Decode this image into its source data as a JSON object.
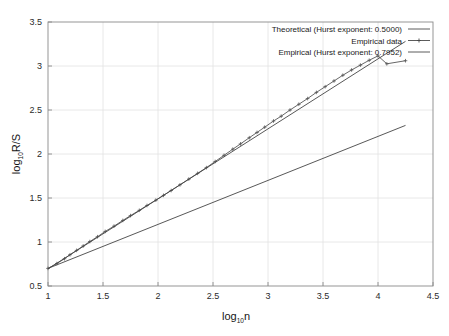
{
  "chart_data": {
    "type": "line",
    "title": "",
    "xlabel": "log10n",
    "ylabel": "log10R/S",
    "xlim": [
      1,
      4.5
    ],
    "ylim": [
      0.5,
      3.5
    ],
    "xticks": [
      "1",
      "1.5",
      "2",
      "2.5",
      "3",
      "3.5",
      "4",
      "4.5"
    ],
    "xtick_values": [
      1,
      1.5,
      2,
      2.5,
      3,
      3.5,
      4,
      4.5
    ],
    "yticks": [
      "0.5",
      "1",
      "1.5",
      "2",
      "2.5",
      "3",
      "3.5"
    ],
    "ytick_values": [
      0.5,
      1,
      1.5,
      2,
      2.5,
      3,
      3.5
    ],
    "grid": true,
    "legend_position": "top-right",
    "series": [
      {
        "name": "Theoretical (Hurst exponent: 0.5000)",
        "style": "line",
        "color": "#444444",
        "hurst": 0.5,
        "x": [
          1.0,
          4.25
        ],
        "y": [
          0.7,
          2.325
        ]
      },
      {
        "name": "Empirical data",
        "style": "line-marker",
        "color": "#555555",
        "marker": "plus",
        "x": [
          1.0,
          1.08,
          1.15,
          1.2,
          1.26,
          1.32,
          1.38,
          1.45,
          1.52,
          1.6,
          1.68,
          1.75,
          1.83,
          1.9,
          1.98,
          2.05,
          2.12,
          2.2,
          2.28,
          2.36,
          2.44,
          2.52,
          2.6,
          2.68,
          2.75,
          2.83,
          2.9,
          2.97,
          3.05,
          3.12,
          3.2,
          3.28,
          3.36,
          3.44,
          3.52,
          3.6,
          3.68,
          3.76,
          3.84,
          3.92,
          4.0,
          4.08,
          4.25
        ],
        "y": [
          0.7,
          0.755,
          0.81,
          0.855,
          0.905,
          0.955,
          1.005,
          1.06,
          1.12,
          1.18,
          1.245,
          1.3,
          1.36,
          1.415,
          1.475,
          1.53,
          1.585,
          1.65,
          1.715,
          1.78,
          1.845,
          1.915,
          1.985,
          2.055,
          2.115,
          2.185,
          2.245,
          2.305,
          2.375,
          2.43,
          2.5,
          2.565,
          2.63,
          2.7,
          2.765,
          2.83,
          2.895,
          2.955,
          3.01,
          3.065,
          3.115,
          3.025,
          3.06
        ]
      },
      {
        "name": "Empirical (Hurst exponent: 0.7952)",
        "style": "line",
        "color": "#444444",
        "hurst": 0.7952,
        "x": [
          1.0,
          4.25
        ],
        "y": [
          0.695,
          3.28
        ]
      }
    ]
  },
  "axes": {
    "ylabel_main": "log",
    "ylabel_sub": "10",
    "ylabel_tail": "R/S",
    "xlabel_main": "log",
    "xlabel_sub": "10",
    "xlabel_tail": "n"
  },
  "legend": {
    "items": [
      {
        "label": "Theoretical (Hurst exponent: 0.5000)",
        "glyph": "line-sample"
      },
      {
        "label": "Empirical data",
        "glyph": "line-marker-sample"
      },
      {
        "label": "Empirical (Hurst exponent: 0.7952)",
        "glyph": "line-sample"
      }
    ]
  },
  "colors": {
    "frame": "#8a8a8a",
    "grid": "#e2e2e2",
    "line": "#4a4a4a",
    "background": "#ffffff"
  }
}
